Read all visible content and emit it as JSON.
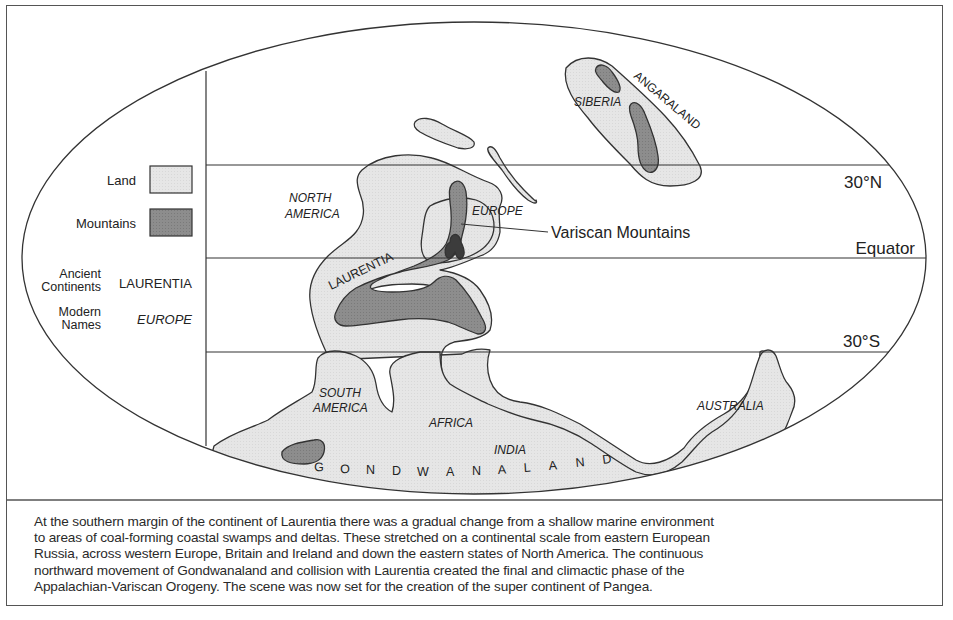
{
  "legend": {
    "land_label": "Land",
    "mountains_label": "Mountains",
    "ancient_label_line1": "Ancient",
    "ancient_label_line2": "Continents",
    "ancient_example": "LAURENTIA",
    "modern_label_line1": "Modern",
    "modern_label_line2": "Names",
    "modern_example": "EUROPE",
    "colors": {
      "land": "#e4e4e4",
      "mountains": "#8a8a8a",
      "outline": "#333333"
    }
  },
  "latitudes": {
    "north": "30°N",
    "equator": "Equator",
    "south": "30°S"
  },
  "labels": {
    "angaraland": "ANGARALAND",
    "siberia": "SIBERIA",
    "north_america_1": "NORTH",
    "north_america_2": "AMERICA",
    "europe": "EUROPE",
    "laurentia": "LAURENTIA",
    "variscan": "Variscan Mountains",
    "south_america_1": "SOUTH",
    "south_america_2": "AMERICA",
    "africa": "AFRICA",
    "india": "INDIA",
    "australia": "AUSTRALIA",
    "gondwanaland_letters": [
      "G",
      "O",
      "N",
      "D",
      "W",
      "A",
      "N",
      "A",
      "L",
      "A",
      "N",
      "D"
    ]
  },
  "caption": {
    "lines": [
      "At the southern margin of the continent of Laurentia there was a gradual change from a shallow marine environment",
      "to areas of coal-forming coastal swamps and deltas. These stretched on a continental scale from eastern European",
      "Russia, across western Europe, Britain and Ireland and down the eastern states of North America. The continuous",
      "northward movement of Gondwanaland and collision with Laurentia created the final and climactic phase of the",
      "Appalachian-Variscan Orogeny. The scene was now set for the creation of the super continent of Pangea."
    ]
  }
}
